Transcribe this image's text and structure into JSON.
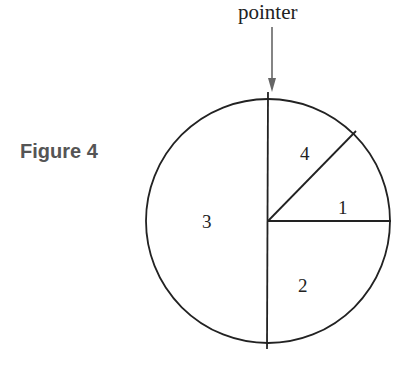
{
  "figure": {
    "label": "Figure 4",
    "pointer_label": "pointer",
    "sectors": [
      {
        "id": "1",
        "label": "1",
        "angle_deg": 45,
        "position": "right-upper"
      },
      {
        "id": "2",
        "label": "2",
        "angle_deg": 90,
        "position": "bottom-right"
      },
      {
        "id": "3",
        "label": "3",
        "angle_deg": 180,
        "position": "left-half"
      },
      {
        "id": "4",
        "label": "4",
        "angle_deg": 45,
        "position": "top-right"
      }
    ]
  }
}
